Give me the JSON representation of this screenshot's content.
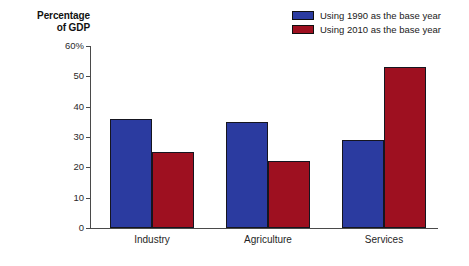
{
  "chart_data": {
    "type": "bar",
    "title": "",
    "subtitle": "",
    "xlabel": "",
    "ylabel": "Percentage\nof GDP",
    "ylabel_lines": [
      "Percentage",
      "of GDP"
    ],
    "categories": [
      "Industry",
      "Agriculture",
      "Services"
    ],
    "series": [
      {
        "name": "Using 1990 as the base year",
        "color": "#2b3ba0",
        "values": [
          36,
          35,
          29
        ]
      },
      {
        "name": "Using 2010 as the base year",
        "color": "#9e1020",
        "values": [
          25,
          22,
          53
        ]
      }
    ],
    "ylim": [
      0,
      60
    ],
    "ytick_values": [
      0,
      10,
      20,
      30,
      40,
      50,
      60
    ],
    "ytick_labels": [
      "0",
      "10",
      "20",
      "30",
      "40",
      "50",
      "60%"
    ],
    "grid": false,
    "legend_position": "top-right"
  },
  "legend": {
    "items": [
      {
        "label": "Using 1990 as the base year",
        "color": "#2b3ba0"
      },
      {
        "label": "Using 2010 as the base year",
        "color": "#9e1020"
      }
    ]
  },
  "axis": {
    "y_title_line1": "Percentage",
    "y_title_line2": "of GDP"
  }
}
